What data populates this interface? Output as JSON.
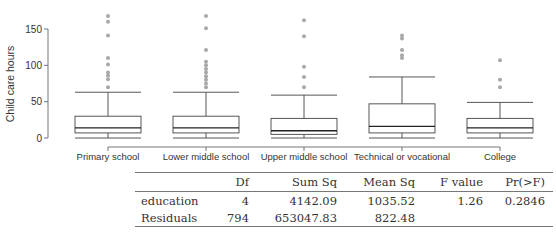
{
  "chart_data": {
    "type": "boxplot",
    "title": "",
    "xlabel": "",
    "ylabel": "Child care hours",
    "ylim": [
      0,
      170
    ],
    "yticks": [
      0,
      50,
      100,
      150
    ],
    "grid": false,
    "legend": null,
    "categories": [
      "Primary school",
      "Lower middle school",
      "Upper middle school",
      "Technical or vocational",
      "College"
    ],
    "boxes": [
      {
        "category": "Primary school",
        "whisker_low": 0,
        "q1": 7,
        "median": 14,
        "q3": 30,
        "whisker_high": 63,
        "outliers": [
          70,
          81,
          86,
          90,
          101,
          110,
          141,
          160,
          168
        ]
      },
      {
        "category": "Lower middle school",
        "whisker_low": 0,
        "q1": 7,
        "median": 14,
        "q3": 30,
        "whisker_high": 63,
        "outliers": [
          70,
          75,
          80,
          85,
          90,
          95,
          100,
          105,
          121,
          151,
          168
        ]
      },
      {
        "category": "Upper middle school",
        "whisker_low": 0,
        "q1": 5,
        "median": 10,
        "q3": 27,
        "whisker_high": 59,
        "outliers": [
          70,
          84,
          98,
          140,
          162
        ]
      },
      {
        "category": "Technical or vocational",
        "whisker_low": 0,
        "q1": 7,
        "median": 16,
        "q3": 47,
        "whisker_high": 84,
        "outliers": [
          110,
          114,
          121,
          137,
          141
        ]
      },
      {
        "category": "College",
        "whisker_low": 0,
        "q1": 7,
        "median": 14,
        "q3": 27,
        "whisker_high": 49,
        "outliers": [
          70,
          80,
          107
        ]
      }
    ]
  },
  "anova_table": {
    "headers": [
      "",
      "Df",
      "Sum Sq",
      "Mean Sq",
      "F value",
      "Pr(>F)"
    ],
    "rows": [
      {
        "label": "education",
        "df": "4",
        "sum_sq": "4142.09",
        "mean_sq": "1035.52",
        "f_value": "1.26",
        "p_value": "0.2846"
      },
      {
        "label": "Residuals",
        "df": "794",
        "sum_sq": "653047.83",
        "mean_sq": "822.48",
        "f_value": "",
        "p_value": ""
      }
    ]
  }
}
